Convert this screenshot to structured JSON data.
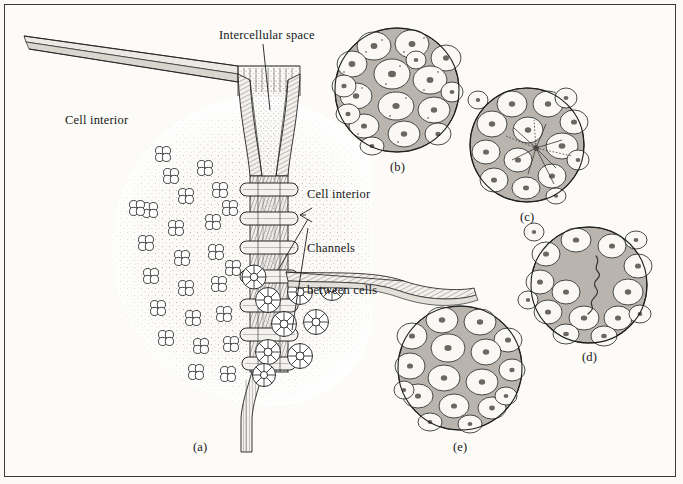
{
  "figure": {
    "background_color": "#fbfaf7",
    "border_color": "#3b3b3b",
    "ink_color": "#171717",
    "membrane_fill": "#f2f0ec",
    "intercellular_fill": "#b9b5ae",
    "cell_fill": "#f7f6f2"
  },
  "labels": {
    "intercellular_space": "Intercellular space",
    "cell_interior_left": "Cell interior",
    "cell_interior_right": "Cell interior",
    "channels_line1": "Channels",
    "channels_line2": "between cells"
  },
  "panels": [
    {
      "id": "a",
      "label": "(a)",
      "caption": "(a)",
      "kind": "freeze-fracture-junction",
      "x": 200,
      "y": 448
    },
    {
      "id": "b",
      "label": "(b)",
      "caption": "(b)",
      "kind": "tissue-cross-section",
      "cx": 397,
      "cy": 90,
      "r": 62,
      "x": 397,
      "y": 170
    },
    {
      "id": "c",
      "label": "(c)",
      "caption": "(c)",
      "kind": "tissue-cross-section",
      "cx": 527,
      "cy": 145,
      "r": 57,
      "x": 527,
      "y": 220
    },
    {
      "id": "d",
      "label": "(d)",
      "caption": "(d)",
      "kind": "tissue-cross-section",
      "cx": 589,
      "cy": 285,
      "r": 58,
      "x": 589,
      "y": 360
    },
    {
      "id": "e",
      "label": "(e)",
      "caption": "(e)",
      "kind": "tissue-cross-section",
      "cx": 460,
      "cy": 368,
      "r": 62,
      "x": 460,
      "y": 450
    }
  ],
  "structures": {
    "connexon_rosette_count": 31,
    "spoked_pore_count": 12,
    "junction_band_count": 7,
    "membrane_sheet_left": "tapering membrane sheet to upper-left",
    "membrane_sheet_right": "tapering membrane sheet to right"
  },
  "panel_contents": {
    "b": {
      "cells": 17,
      "note": "loosely packed cells, broad intercellular space"
    },
    "c": {
      "cells": 16,
      "note": "radiating star-shaped junction complex at centre"
    },
    "d": {
      "cells": 16,
      "note": "large central intercellular space with filament"
    },
    "e": {
      "cells": 17,
      "note": "closely packed cells with narrow intercellular space"
    }
  }
}
